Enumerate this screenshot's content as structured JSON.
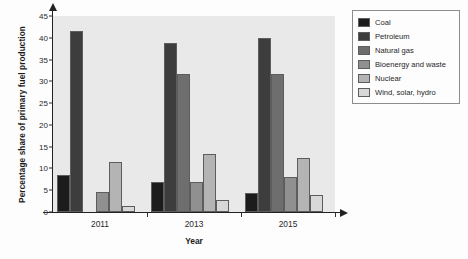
{
  "chart_data": {
    "type": "bar",
    "title": "",
    "subtitle": "",
    "xlabel": "Year",
    "ylabel": "Percentage share of primary fuel production",
    "categories": [
      "2011",
      "2013",
      "2015"
    ],
    "ylim": [
      0,
      45
    ],
    "ytick_values": [
      0,
      5,
      10,
      15,
      20,
      25,
      30,
      35,
      40,
      45
    ],
    "ytick_labels": [
      "0",
      "5",
      "10",
      "15",
      "20",
      "25",
      "30",
      "35",
      "40",
      "45"
    ],
    "grid": false,
    "legend_position": "right",
    "plot_background": "#e9e9e9",
    "axis_color": "#222222",
    "series": [
      {
        "name": "Coal",
        "color": "#1c1c1c",
        "values": [
          8.4,
          7.0,
          4.4
        ]
      },
      {
        "name": "Petroleum",
        "color": "#3d3d3d",
        "values": [
          41.6,
          38.9,
          40.0
        ]
      },
      {
        "name": "Natural gas",
        "color": "#6e6e6e",
        "values": [
          0.0,
          31.6,
          31.7
        ]
      },
      {
        "name": "Bioenergy and waste",
        "color": "#909090",
        "values": [
          4.6,
          6.8,
          8.0
        ]
      },
      {
        "name": "Nuclear",
        "color": "#b4b4b4",
        "values": [
          11.5,
          13.4,
          12.5
        ]
      },
      {
        "name": "Wind, solar, hydro",
        "color": "#d8d8d8",
        "values": [
          1.4,
          2.8,
          3.9
        ]
      }
    ]
  }
}
